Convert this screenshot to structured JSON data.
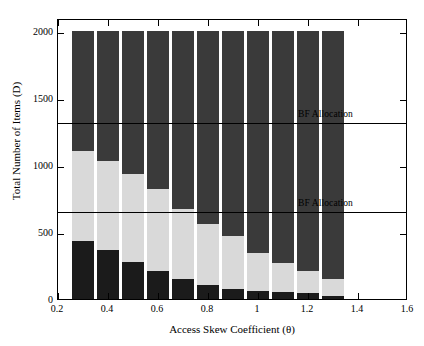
{
  "chart_data": {
    "type": "bar",
    "subtype": "stacked",
    "title": "",
    "xlabel": "Access Skew Coefficient (θ)",
    "ylabel": "Total Number of Items (D)",
    "xlim": [
      0.2,
      1.6
    ],
    "ylim": [
      0,
      2100
    ],
    "grid": false,
    "x": [
      0.3,
      0.4,
      0.5,
      0.6,
      0.7,
      0.8,
      0.9,
      1.0,
      1.1,
      1.2,
      1.3
    ],
    "categories": [
      "0.3",
      "0.4",
      "0.5",
      "0.6",
      "0.7",
      "0.8",
      "0.9",
      "1",
      "1.1",
      "1.2",
      "1.3"
    ],
    "series": [
      {
        "name": "Channel 1",
        "color": "#1b1b1b",
        "values": [
          433,
          364,
          277,
          208,
          147,
          104,
          78,
          61,
          52,
          43,
          26
        ]
      },
      {
        "name": "Channel 2",
        "color": "#d9d9d9",
        "values": [
          675,
          666,
          658,
          615,
          528,
          459,
          390,
          286,
          216,
          165,
          121
        ]
      },
      {
        "name": "Channel 3",
        "color": "#3a3a3a",
        "values": [
          892,
          970,
          1065,
          1177,
          1325,
          1437,
          1532,
          1653,
          1732,
          1792,
          1853
        ]
      }
    ],
    "totals": [
      2000,
      2000,
      2000,
      2000,
      2000,
      2000,
      2000,
      2000,
      2000,
      2000,
      2000
    ],
    "ytick_values": [
      0,
      500,
      1000,
      1500,
      2000
    ],
    "ytick_labels": [
      "0",
      "500",
      "1000",
      "1500",
      "2000"
    ],
    "xtick_values": [
      0.2,
      0.4,
      0.6,
      0.8,
      1.0,
      1.2,
      1.4,
      1.6
    ],
    "xtick_labels": [
      "0.2",
      "0.4",
      "0.6",
      "0.8",
      "1",
      "1.2",
      "1.4",
      "1.6"
    ],
    "annotations": [
      {
        "name": "bf-allocation-upper",
        "text": "BF Allocation",
        "y": 1333,
        "label_x": 1.16
      },
      {
        "name": "bf-allocation-lower",
        "text": "BF Allocation",
        "y": 667,
        "label_x": 1.16
      }
    ],
    "legend": {
      "position": "top-right",
      "entries": [
        {
          "label": "Channel 1",
          "color": "#1b1b1b"
        },
        {
          "label": "Channel 2",
          "color": "#d9d9d9"
        },
        {
          "label": "Channel 3",
          "color": "#3a3a3a"
        }
      ]
    }
  }
}
